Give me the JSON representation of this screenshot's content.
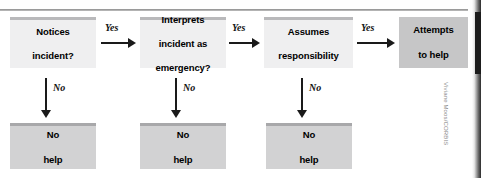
{
  "figure": {
    "credit": "Viviane Moos/CORBIS",
    "colors": {
      "box_light": "#efeff0",
      "box_light_accent": "#b9b9bb",
      "box_mid": "#d2d2d3",
      "box_mid_accent": "#a8a8aa",
      "box_dark": "#c6c6c7",
      "arrow": "#1a1a1a",
      "rule": "#9a9a9a",
      "text": "#000000",
      "credit_text": "#8e8e8e"
    }
  },
  "flow": {
    "steps": [
      {
        "id": "notices",
        "line1": "Notices",
        "line2": "incident?"
      },
      {
        "id": "interprets",
        "line1": "Interprets",
        "line2": "incident as",
        "line3": "emergency?"
      },
      {
        "id": "assumes",
        "line1": "Assumes",
        "line2": "responsibility"
      },
      {
        "id": "attempts",
        "line1": "Attempts",
        "line2": "to help"
      }
    ],
    "outcomes": [
      {
        "id": "no-help-1",
        "line1": "No",
        "line2": "help"
      },
      {
        "id": "no-help-2",
        "line1": "No",
        "line2": "help"
      },
      {
        "id": "no-help-3",
        "line1": "No",
        "line2": "help"
      }
    ],
    "yes_labels": [
      "Yes",
      "Yes",
      "Yes"
    ],
    "no_labels": [
      "No",
      "No",
      "No"
    ]
  }
}
